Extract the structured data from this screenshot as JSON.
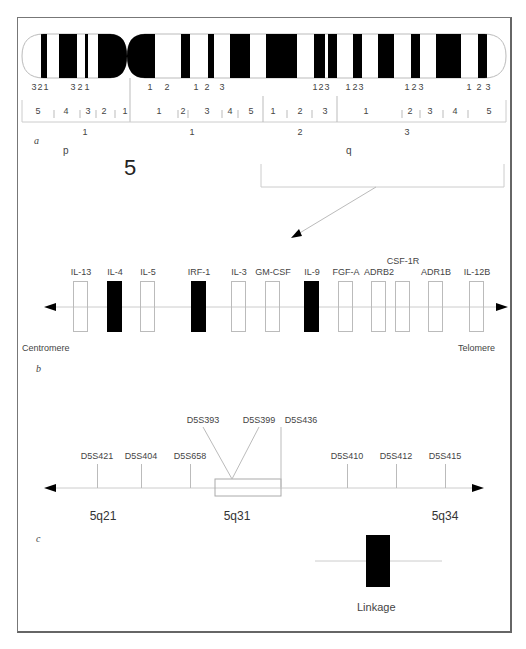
{
  "figure": {
    "panel_labels": {
      "a": "a",
      "b": "b",
      "c": "c"
    },
    "chromosome_number": "5",
    "arm_labels": {
      "p": "p",
      "q": "q"
    }
  },
  "panel_a": {
    "band_labels_top": [
      {
        "x": 34,
        "text": "3"
      },
      {
        "x": 40,
        "text": "2"
      },
      {
        "x": 46,
        "text": "1"
      },
      {
        "x": 73,
        "text": "3"
      },
      {
        "x": 80,
        "text": "2"
      },
      {
        "x": 87,
        "text": "1"
      },
      {
        "x": 150,
        "text": "1"
      },
      {
        "x": 167,
        "text": "2"
      },
      {
        "x": 196,
        "text": "1"
      },
      {
        "x": 207,
        "text": "2"
      },
      {
        "x": 222,
        "text": "3"
      },
      {
        "x": 315,
        "text": "1"
      },
      {
        "x": 321,
        "text": "2"
      },
      {
        "x": 327,
        "text": "3"
      },
      {
        "x": 348,
        "text": "1"
      },
      {
        "x": 355,
        "text": "2"
      },
      {
        "x": 361,
        "text": "3"
      },
      {
        "x": 407,
        "text": "1"
      },
      {
        "x": 414,
        "text": "2"
      },
      {
        "x": 421,
        "text": "3"
      },
      {
        "x": 469,
        "text": "1"
      },
      {
        "x": 479,
        "text": "2"
      },
      {
        "x": 488,
        "text": "3"
      }
    ],
    "subband_labels": [
      {
        "x": 38,
        "text": "5"
      },
      {
        "x": 66,
        "text": "4"
      },
      {
        "x": 88,
        "text": "3"
      },
      {
        "x": 104,
        "text": "2"
      },
      {
        "x": 125,
        "text": "1"
      },
      {
        "x": 159,
        "text": "1"
      },
      {
        "x": 183,
        "text": "2"
      },
      {
        "x": 207,
        "text": "3"
      },
      {
        "x": 230,
        "text": "4"
      },
      {
        "x": 251,
        "text": "5"
      },
      {
        "x": 273,
        "text": "1"
      },
      {
        "x": 300,
        "text": "2"
      },
      {
        "x": 325,
        "text": "3"
      },
      {
        "x": 366,
        "text": "1"
      },
      {
        "x": 410,
        "text": "2"
      },
      {
        "x": 430,
        "text": "3"
      },
      {
        "x": 455,
        "text": "4"
      },
      {
        "x": 489,
        "text": "5"
      }
    ],
    "region_labels": [
      {
        "x": 85,
        "text": "1"
      },
      {
        "x": 192,
        "text": "1"
      },
      {
        "x": 300,
        "text": "2"
      },
      {
        "x": 407,
        "text": "3"
      }
    ]
  },
  "panel_b": {
    "genes": [
      {
        "name": "IL-13",
        "x": 81,
        "filled": false
      },
      {
        "name": "IL-4",
        "x": 115,
        "filled": true
      },
      {
        "name": "IL-5",
        "x": 148,
        "filled": false
      },
      {
        "name": "IRF-1",
        "x": 199,
        "filled": true
      },
      {
        "name": "IL-3",
        "x": 239,
        "filled": false
      },
      {
        "name": "GM-CSF",
        "x": 273,
        "filled": false
      },
      {
        "name": "IL-9",
        "x": 312,
        "filled": true
      },
      {
        "name": "FGF-A",
        "x": 346,
        "filled": false
      },
      {
        "name": "ADRB2",
        "x": 379,
        "filled": false
      },
      {
        "name": "CSF-1R",
        "x": 403,
        "filled": false
      },
      {
        "name": "ADR1B",
        "x": 436,
        "filled": false
      },
      {
        "name": "IL-12B",
        "x": 477,
        "filled": false
      }
    ],
    "left_end_label": "Centromere",
    "right_end_label": "Telomere"
  },
  "panel_c": {
    "markers": [
      {
        "name": "D5S421",
        "x": 97
      },
      {
        "name": "D5S404",
        "x": 141
      },
      {
        "name": "D5S658",
        "x": 190
      },
      {
        "name": "D5S410",
        "x": 347
      },
      {
        "name": "D5S412",
        "x": 396
      },
      {
        "name": "D5S415",
        "x": 445
      }
    ],
    "interval_markers": [
      {
        "name": "D5S393",
        "x": 203
      },
      {
        "name": "D5S399",
        "x": 259
      },
      {
        "name": "D5S436",
        "x": 301
      }
    ],
    "position_labels": [
      {
        "x": 103,
        "text": "5q21"
      },
      {
        "x": 237,
        "text": "5q31"
      },
      {
        "x": 445,
        "text": "5q34"
      }
    ],
    "legend_label": "Linkage"
  },
  "colors": {
    "band_black": "#000000",
    "line_gray": "#aaaaaa",
    "text_gray": "#444444",
    "frame_gray": "#777777"
  }
}
